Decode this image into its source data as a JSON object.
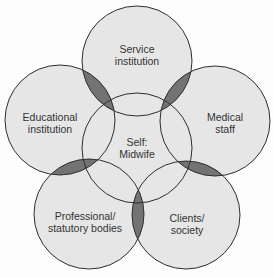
{
  "diagram": {
    "type": "venn-flower",
    "center": {
      "id": "self",
      "line1": "Self:",
      "line2": "Midwife"
    },
    "petals": [
      {
        "id": "service",
        "line1": "Service",
        "line2": "institution"
      },
      {
        "id": "medical",
        "line1": "Medical",
        "line2": "staff"
      },
      {
        "id": "clients",
        "line1": "Clients/",
        "line2": "society"
      },
      {
        "id": "professional",
        "line1": "Professional/",
        "line2": "statutory bodies"
      },
      {
        "id": "educational",
        "line1": "Educational",
        "line2": "institution"
      }
    ],
    "colors": {
      "circle_fill": "#e6e6e6",
      "overlap_fill": "#737373",
      "stroke": "#2e2e2e",
      "text": "#333333"
    }
  }
}
